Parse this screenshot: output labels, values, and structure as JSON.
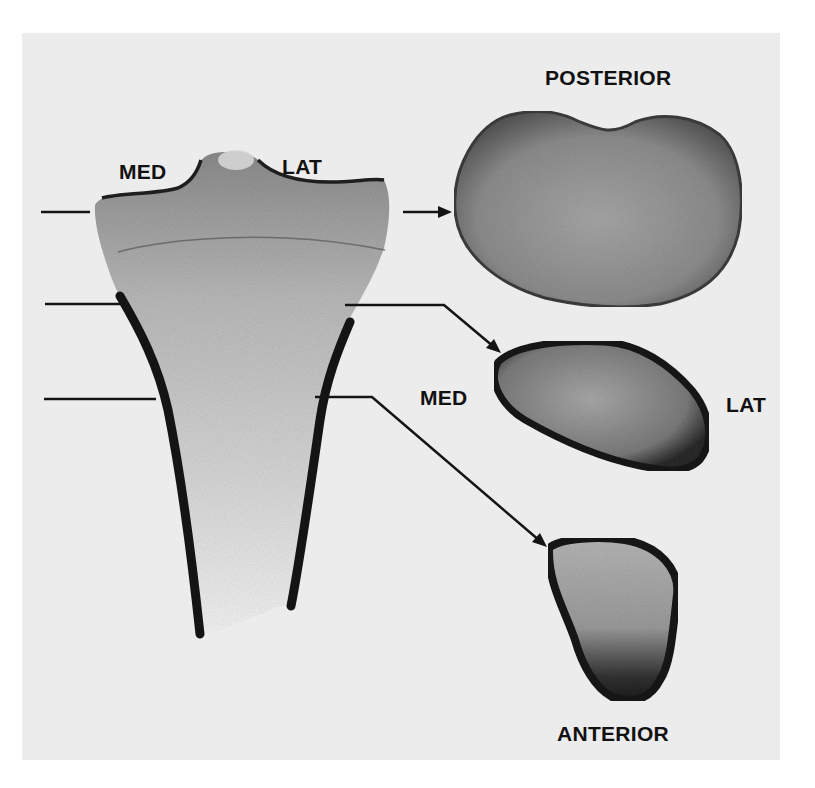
{
  "figure": {
    "colors": {
      "background": "#ececec",
      "page": "#ffffff",
      "bone_cortex": "#1a1a1a",
      "trabecular": "#8a8a8a",
      "ink": "#111111"
    },
    "labels": {
      "top_med": "MED",
      "top_lat": "LAT",
      "posterior": "POSTERIOR",
      "mid_med": "MED",
      "mid_lat": "LAT",
      "anterior": "ANTERIOR"
    },
    "section_levels": [
      {
        "level": 1,
        "y": 212,
        "target": "cross-section-1"
      },
      {
        "level": 2,
        "y": 305,
        "target": "cross-section-2"
      },
      {
        "level": 3,
        "y": 398,
        "target": "cross-section-3"
      }
    ]
  }
}
